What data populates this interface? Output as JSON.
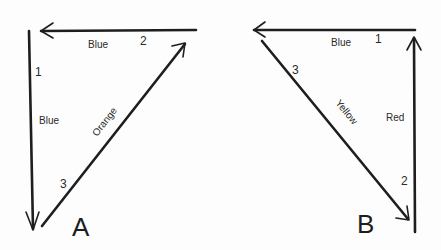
{
  "figure": {
    "diagrams": [
      {
        "id": "A",
        "letter": "A",
        "vectors": [
          {
            "order": "1",
            "color_label": "Blue",
            "direction": "down"
          },
          {
            "order": "2",
            "color_label": "Blue",
            "direction": "left"
          },
          {
            "order": "3",
            "color_label": "Orange",
            "direction": "up-right"
          }
        ]
      },
      {
        "id": "B",
        "letter": "B",
        "vectors": [
          {
            "order": "1",
            "color_label": "Blue",
            "direction": "left"
          },
          {
            "order": "2",
            "color_label": "Red",
            "direction": "up"
          },
          {
            "order": "3",
            "color_label": "Yellow",
            "direction": "down-right"
          }
        ]
      }
    ]
  }
}
